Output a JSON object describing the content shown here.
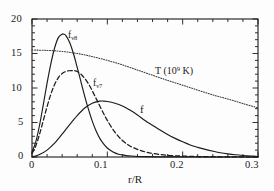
{
  "chart_data": {
    "type": "line",
    "title": "",
    "xlabel": "r/R",
    "ylabel": "",
    "xlim": [
      0,
      0.3
    ],
    "ylim": [
      0,
      20
    ],
    "grid": false,
    "legend": "inline-annotations",
    "xticks": [
      "0",
      "0.1",
      "0.2",
      "0.3"
    ],
    "xtick_values": [
      0,
      0.1,
      0.2,
      0.3
    ],
    "yticks": [
      "0",
      "5",
      "10",
      "15",
      "20"
    ],
    "ytick_values": [
      0,
      5,
      10,
      15,
      20
    ],
    "x_minor_tick_step": 0.02,
    "y_minor_tick_step": 1,
    "series": [
      {
        "name": "f_nu8",
        "label_text": "f",
        "label_sub": "ν8",
        "style": "solid",
        "color": "#1a1a1a",
        "peak_x": 0.042,
        "peak_y": 17.8,
        "x": [
          0.0,
          0.005,
          0.01,
          0.015,
          0.02,
          0.025,
          0.03,
          0.035,
          0.04,
          0.042,
          0.045,
          0.05,
          0.055,
          0.06,
          0.065,
          0.07,
          0.075,
          0.08,
          0.085,
          0.09,
          0.095,
          0.1,
          0.105,
          0.11,
          0.115,
          0.12,
          0.125,
          0.13,
          0.14,
          0.15,
          0.17,
          0.2,
          0.25,
          0.3
        ],
        "y": [
          0.7,
          2.2,
          4.6,
          7.6,
          10.7,
          13.5,
          15.8,
          17.3,
          17.8,
          17.8,
          17.6,
          16.6,
          15.0,
          13.0,
          10.9,
          8.8,
          6.9,
          5.2,
          3.8,
          2.7,
          1.9,
          1.3,
          0.9,
          0.6,
          0.4,
          0.3,
          0.2,
          0.15,
          0.08,
          0.05,
          0.02,
          0.01,
          0.0,
          0.0
        ]
      },
      {
        "name": "f_nu7",
        "label_text": "f",
        "label_sub": "ν7",
        "style": "dashed",
        "color": "#1a1a1a",
        "peak_x": 0.057,
        "peak_y": 12.5,
        "x": [
          0.0,
          0.005,
          0.01,
          0.015,
          0.02,
          0.025,
          0.03,
          0.035,
          0.04,
          0.045,
          0.05,
          0.055,
          0.057,
          0.06,
          0.065,
          0.07,
          0.075,
          0.08,
          0.085,
          0.09,
          0.095,
          0.1,
          0.11,
          0.12,
          0.13,
          0.14,
          0.15,
          0.16,
          0.17,
          0.18,
          0.19,
          0.2,
          0.22,
          0.25,
          0.3
        ],
        "y": [
          0.5,
          1.6,
          3.3,
          5.3,
          7.3,
          9.1,
          10.5,
          11.5,
          12.1,
          12.4,
          12.5,
          12.5,
          12.5,
          12.4,
          12.0,
          11.4,
          10.6,
          9.6,
          8.5,
          7.4,
          6.3,
          5.3,
          3.6,
          2.4,
          1.6,
          1.1,
          0.75,
          0.52,
          0.36,
          0.25,
          0.18,
          0.13,
          0.07,
          0.03,
          0.0
        ]
      },
      {
        "name": "f",
        "label_text": "f",
        "label_sub": "",
        "style": "solid",
        "color": "#1a1a1a",
        "peak_x": 0.095,
        "peak_y": 8.1,
        "x": [
          0.0,
          0.01,
          0.02,
          0.03,
          0.04,
          0.05,
          0.06,
          0.07,
          0.08,
          0.09,
          0.095,
          0.1,
          0.11,
          0.12,
          0.13,
          0.14,
          0.15,
          0.16,
          0.17,
          0.18,
          0.19,
          0.2,
          0.21,
          0.22,
          0.23,
          0.24,
          0.25,
          0.26,
          0.27,
          0.28,
          0.29,
          0.3
        ],
        "y": [
          0.0,
          0.35,
          1.0,
          2.0,
          3.3,
          4.7,
          6.0,
          7.1,
          7.8,
          8.1,
          8.1,
          8.05,
          7.8,
          7.4,
          6.8,
          6.1,
          5.3,
          4.6,
          3.9,
          3.25,
          2.7,
          2.2,
          1.75,
          1.4,
          1.1,
          0.85,
          0.62,
          0.45,
          0.32,
          0.22,
          0.14,
          0.08
        ]
      },
      {
        "name": "T",
        "label_text": "T (10",
        "label_sup": "9",
        "label_tail": " K)",
        "style": "dotted",
        "color": "#3a3a3a",
        "start_y": 15.5,
        "end_y": 7.1,
        "x": [
          0.0,
          0.02,
          0.04,
          0.06,
          0.08,
          0.1,
          0.12,
          0.14,
          0.16,
          0.18,
          0.2,
          0.22,
          0.24,
          0.26,
          0.28,
          0.3
        ],
        "y": [
          15.5,
          15.45,
          15.3,
          15.0,
          14.55,
          14.0,
          13.35,
          12.6,
          11.85,
          11.1,
          10.4,
          9.7,
          9.0,
          8.4,
          7.75,
          7.1
        ]
      }
    ]
  },
  "axis": {
    "x_title": "r/R",
    "x_labels": [
      "0",
      "0.1",
      "0.2",
      "0.3"
    ],
    "y_labels": [
      "0",
      "5",
      "10",
      "15",
      "20"
    ]
  },
  "annotations": {
    "label_fnu8": "f",
    "label_fnu8_sub": "ν8",
    "label_fnu7": "f",
    "label_fnu7_sub": "ν7",
    "label_f": "f",
    "label_T_head": "T (10",
    "label_T_exp": "9",
    "label_T_tail": " K)"
  }
}
